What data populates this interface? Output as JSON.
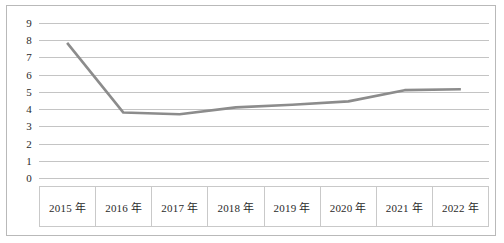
{
  "chart_data": {
    "type": "line",
    "title": "",
    "subtitle": "",
    "xlabel": "",
    "ylabel": "",
    "categories": [
      "2015 年",
      "2016 年",
      "2017 年",
      "2018 年",
      "2019 年",
      "2020 年",
      "2021 年",
      "2022 年"
    ],
    "values": [
      7.85,
      3.8,
      3.7,
      4.1,
      4.25,
      4.45,
      5.1,
      5.15
    ],
    "series": [
      {
        "name": "",
        "values": [
          7.85,
          3.8,
          3.7,
          4.1,
          4.25,
          4.45,
          5.1,
          5.15
        ]
      }
    ],
    "ylim": [
      0,
      9
    ],
    "yticks": [
      "9",
      "8",
      "7",
      "6",
      "5",
      "4",
      "3",
      "2",
      "1",
      "0"
    ],
    "ytick_values": [
      9,
      8,
      7,
      6,
      5,
      4,
      3,
      2,
      1,
      0
    ],
    "grid": true,
    "grid_axis": "y",
    "legend": false,
    "legend_position": "none",
    "markers": false,
    "annotations": [],
    "colors": {
      "line": "#8c8c8c",
      "gridline": "#c4c4c4",
      "border": "#b9b9b9",
      "table_border": "#c9c9c9",
      "text": "#2a2a2a",
      "background": "#ffffff"
    },
    "line_width": 2.6
  }
}
